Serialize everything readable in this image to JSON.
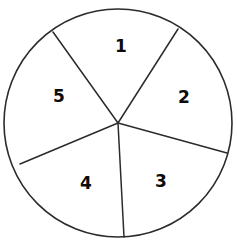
{
  "figure": {
    "kind": "circle-divided-into-sectors",
    "background_color": "#ffffff",
    "stroke_color": "#2b2b2b",
    "label_color": "#0b0b0b",
    "circle": {
      "center_x": 118,
      "center_y": 123,
      "radius": 114
    },
    "sector_count": 5
  },
  "chart_data": {
    "type": "pie",
    "title": "",
    "xlabel": "",
    "ylabel": "",
    "legend": "none",
    "grid": false,
    "categories": [
      "1",
      "2",
      "3",
      "4",
      "5"
    ],
    "values": [
      72,
      73,
      65,
      72,
      78
    ],
    "units": "degrees"
  },
  "sectors": [
    {
      "label": "1",
      "label_x": 121,
      "label_y": 46,
      "name": "sector-1"
    },
    {
      "label": "2",
      "label_x": 184,
      "label_y": 97,
      "name": "sector-2"
    },
    {
      "label": "3",
      "label_x": 161,
      "label_y": 181,
      "name": "sector-3"
    },
    {
      "label": "4",
      "label_x": 86,
      "label_y": 183,
      "name": "sector-4"
    },
    {
      "label": "5",
      "label_x": 59,
      "label_y": 96,
      "name": "sector-5"
    }
  ],
  "spokes": [
    {
      "name": "spoke-to-upper-left",
      "x1": 118,
      "y1": 123,
      "x2": 53,
      "y2": 32
    },
    {
      "name": "spoke-to-upper-right",
      "x1": 118,
      "y1": 123,
      "x2": 178,
      "y2": 29
    },
    {
      "name": "spoke-to-right",
      "x1": 118,
      "y1": 123,
      "x2": 227,
      "y2": 153
    },
    {
      "name": "spoke-to-bottom",
      "x1": 118,
      "y1": 123,
      "x2": 124,
      "y2": 237
    },
    {
      "name": "spoke-to-left",
      "x1": 118,
      "y1": 123,
      "x2": 20,
      "y2": 164
    }
  ],
  "sector_paths": [
    {
      "name": "sector-1-region",
      "d": "M118,123 L53,32 A114,114 0 0,1 178,29 Z"
    },
    {
      "name": "sector-2-region",
      "d": "M118,123 L178,29 A114,114 0 0,1 227,153 Z"
    },
    {
      "name": "sector-3-region",
      "d": "M118,123 L227,153 A114,114 0 0,1 124,237 Z"
    },
    {
      "name": "sector-4-region",
      "d": "M118,123 L124,237 A114,114 0 0,1 20,164 Z"
    },
    {
      "name": "sector-5-region",
      "d": "M118,123 L20,164 A114,114 0 0,1 53,32 Z"
    }
  ]
}
